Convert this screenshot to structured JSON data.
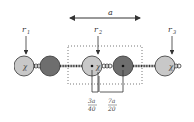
{
  "diagram": {
    "spacing_label": "a",
    "position_labels": [
      {
        "sub": "1",
        "base": "r"
      },
      {
        "sub": "2",
        "base": "r"
      },
      {
        "sub": "3",
        "base": "r"
      }
    ],
    "bond_symbol": "χ",
    "offset_labels": [
      {
        "num": "3a",
        "den": "40"
      },
      {
        "num": "7a",
        "den": "20"
      }
    ],
    "colors": {
      "light_atom": "#c8c8c8",
      "dark_atom": "#6e6e6e",
      "outline": "#333333",
      "box": "#555555"
    },
    "atoms": [
      {
        "type": "light",
        "cx": 24
      },
      {
        "type": "dark",
        "cx": 50
      },
      {
        "type": "light",
        "cx": 92
      },
      {
        "type": "dark",
        "cx": 123
      },
      {
        "type": "light",
        "cx": 165
      }
    ]
  }
}
